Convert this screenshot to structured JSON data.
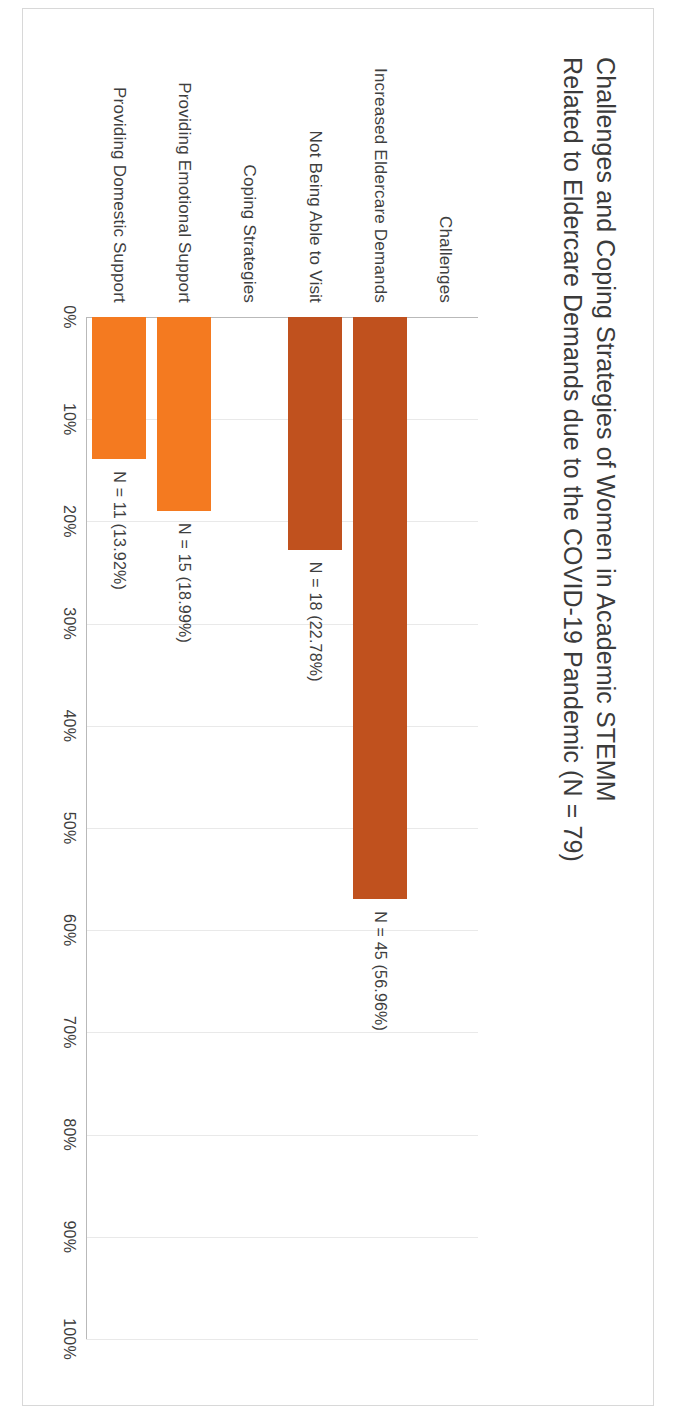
{
  "chart_data": {
    "type": "bar",
    "orientation": "vertical",
    "title": "Challenges and Coping Strategies of Women in Academic STEMM Related to Eldercare Demands due to the COVID-19 Pandemic (N = 79)",
    "xlabel": "",
    "ylabel": "",
    "ylim": [
      0,
      100
    ],
    "ytick_labels": [
      "0%",
      "10%",
      "20%",
      "30%",
      "40%",
      "50%",
      "60%",
      "70%",
      "80%",
      "90%",
      "100%"
    ],
    "ytick_values": [
      0,
      10,
      20,
      30,
      40,
      50,
      60,
      70,
      80,
      90,
      100
    ],
    "grid": true,
    "legend": "none",
    "total_n": 79,
    "groups": [
      {
        "name": "Challenges",
        "color": "#c0511e",
        "items": [
          {
            "category": "Increased Eldercare Demands",
            "n": 45,
            "percent": 56.96,
            "label": "N = 45 (56.96%)"
          },
          {
            "category": "Not Being Able to Visit",
            "n": 18,
            "percent": 22.78,
            "label": "N = 18 (22.78%)"
          }
        ]
      },
      {
        "name": "Coping Strategies",
        "color": "#f47a20",
        "items": [
          {
            "category": "Providing Emotional Support",
            "n": 15,
            "percent": 18.99,
            "label": "N = 15 (18.99%)"
          },
          {
            "category": "Providing Domestic Support",
            "n": 11,
            "percent": 13.92,
            "label": "N = 11 (13.92%)"
          }
        ]
      }
    ],
    "categories": [
      "Challenges",
      "Increased Eldercare Demands",
      "Not Being Able to Visit",
      "Coping Strategies",
      "Providing Emotional Support",
      "Providing Domestic Support"
    ],
    "values": [
      null,
      56.96,
      22.78,
      null,
      18.99,
      13.92
    ],
    "value_labels": [
      "",
      "N = 45 (56.96%)",
      "N = 18 (22.78%)",
      "",
      "N = 15 (18.99%)",
      "N = 11 (13.92%)"
    ]
  },
  "colors": {
    "challenge_bar": "#c0511e",
    "coping_bar": "#f47a20",
    "gridline": "#e9e9e9",
    "axis": "#b9b9b9",
    "text": "#3e3e3e",
    "title_text": "#3b3b3b",
    "page_background": "#ffffff"
  }
}
